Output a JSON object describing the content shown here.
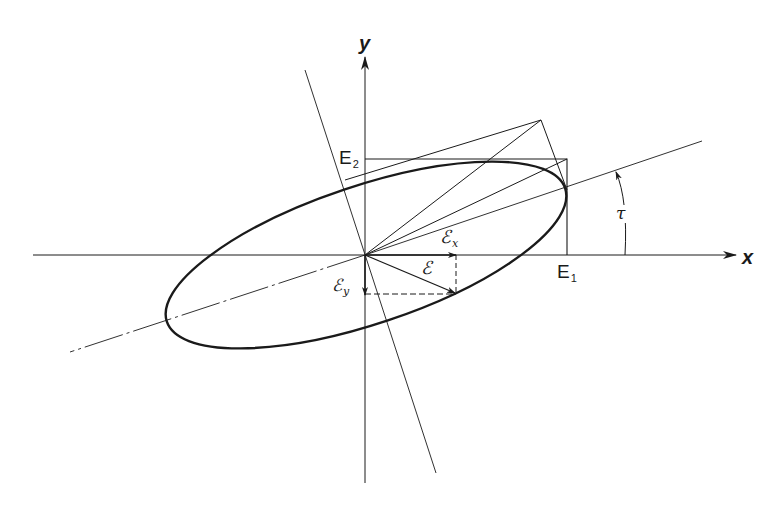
{
  "figure": {
    "stroke_color": "#1a1a1a",
    "background": "#ffffff"
  },
  "labels": {
    "x_axis": "x",
    "y_axis": "y",
    "E1_main": "E",
    "E1_sub": "1",
    "E2_main": "E",
    "E2_sub": "2",
    "tau": "τ",
    "field_vector": "ℰ",
    "field_x_main": "ℰ",
    "field_x_sub": "x",
    "field_y_main": "ℰ",
    "field_y_sub": "y"
  }
}
